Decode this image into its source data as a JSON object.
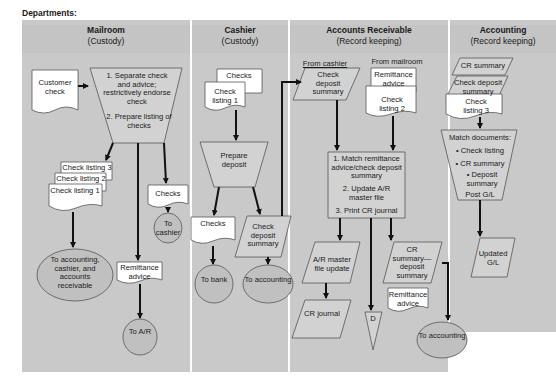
{
  "diagram": {
    "title": "Departments:",
    "lanes": [
      {
        "name": "Mailroom",
        "role": "(Custody)"
      },
      {
        "name": "Cashier",
        "role": "(Custody)"
      },
      {
        "name": "Accounts Receivable",
        "role": "(Record keeping)"
      },
      {
        "name": "Accounting",
        "role": "(Record keeping)"
      }
    ],
    "mailroom": {
      "customer_check": "Customer check",
      "process_1": "1. Separate check and advice; restrictively endorse check",
      "process_2": "2. Prepare listing of checks",
      "check_listing_3": "Check listing 3",
      "check_listing_2": "Check listing 2",
      "check_listing_1": "Check listing 1",
      "checks": "Checks",
      "to_cashier": "To cashier",
      "to_accounting_cashier_ar": "To accounting, cashier, and accounts receivable",
      "remittance_advice": "Remittance advice",
      "to_ar": "To A/R"
    },
    "cashier": {
      "checks_in": "Checks",
      "check_listing_1": "Check listing 1",
      "prepare_deposit": "Prepare deposit",
      "checks_out": "Checks",
      "check_deposit_summary": "Check deposit summary",
      "to_bank": "To bank",
      "to_accounting": "To accounting"
    },
    "accounts_receivable": {
      "from_cashier": "From cashier",
      "check_deposit_summary": "Check deposit summary",
      "from_mailroom": "From mailroom",
      "remittance_advice": "Remittance advice",
      "check_listing_2": "Check listing 2",
      "process_1": "1. Match remittance advice/check deposit summary",
      "process_2": "2. Update A/R master file",
      "process_3": "3. Print CR journal",
      "ar_master_file_update": "A/R master file update",
      "cr_journal": "CR journal",
      "file_d": "D",
      "cr_summary_deposit_summary": "CR summary— deposit summary",
      "remittance_advice_out": "Remittance advice",
      "to_accounting": "To accounting"
    },
    "accounting": {
      "cr_summary": "CR summary",
      "check_deposit_summary": "Check deposit summary",
      "check_listing_3": "Check listing 3",
      "match_documents": "Match documents:",
      "bullet_1": "• Check listing",
      "bullet_2": "• CR summary",
      "bullet_3": "• Deposit summary",
      "post_gl": "Post G/L",
      "updated_gl": "Updated G/L"
    },
    "colors": {
      "lane_bg": "#c9c9c9",
      "header_bg": "#c4c4c4",
      "shape_fill": "#d2d2d2",
      "document_fill": "#ffffff",
      "line": "#111111"
    }
  }
}
